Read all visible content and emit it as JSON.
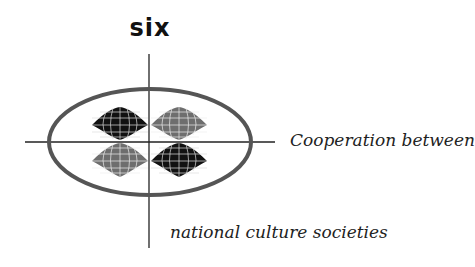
{
  "title": "six",
  "captions": {
    "line1": "Cooperation between",
    "line2": "national culture societies"
  },
  "figure": {
    "quadrants": [
      {
        "position": "top-left",
        "shade": "dark"
      },
      {
        "position": "top-right",
        "shade": "light"
      },
      {
        "position": "bottom-left",
        "shade": "light"
      },
      {
        "position": "bottom-right",
        "shade": "dark"
      }
    ],
    "colors": {
      "dark": "#111111",
      "light": "#6e6e6e",
      "grid": "#e8e8e8",
      "ellipse": "#555555",
      "axis": "#222222"
    }
  }
}
